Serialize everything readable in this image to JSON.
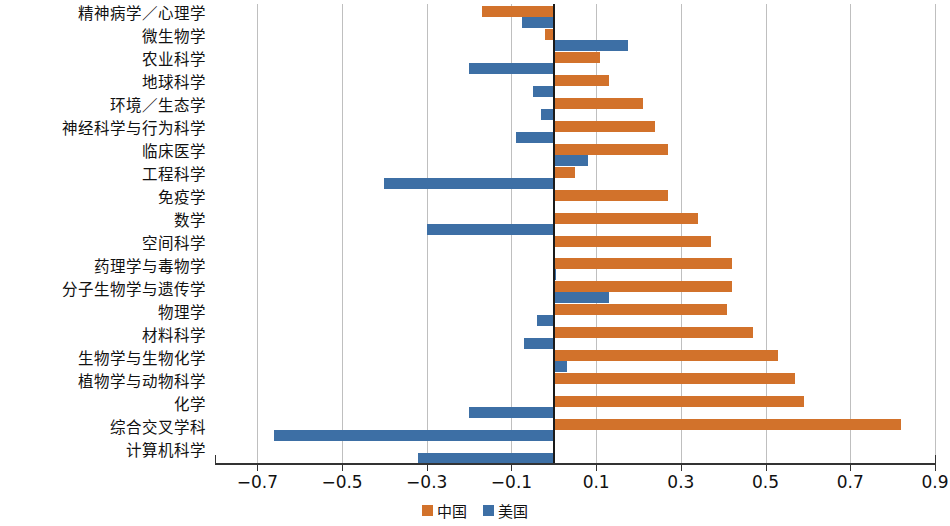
{
  "chart_data": {
    "type": "bar",
    "orientation": "horizontal",
    "title": "",
    "subtitle": "",
    "xlabel": "",
    "ylabel": "",
    "xlim": [
      -0.7,
      0.9
    ],
    "xticks": [
      "-0.7",
      "-0.5",
      "-0.3",
      "-0.1",
      "0.1",
      "0.3",
      "0.5",
      "0.7",
      "0.9"
    ],
    "xtick_values": [
      -0.7,
      -0.5,
      -0.3,
      -0.1,
      0.1,
      0.3,
      0.5,
      0.7,
      0.9
    ],
    "grid": true,
    "grid_axis": "x",
    "legend_position": "bottom",
    "zero_reference_line": true,
    "categories": [
      "精神病学／心理学",
      "微生物学",
      "农业科学",
      "地球科学",
      "环境／生态学",
      "神经科学与行为科学",
      "临床医学",
      "工程科学",
      "免疫学",
      "数学",
      "空间科学",
      "药理学与毒物学",
      "分子生物学与遗传学",
      "物理学",
      "材料科学",
      "生物学与生物化学",
      "植物学与动物科学",
      "化学",
      "综合交叉学科",
      "计算机科学"
    ],
    "series": [
      {
        "name": "中国",
        "color": "#d2722b",
        "values": [
          -0.17,
          -0.02,
          0.11,
          0.13,
          0.21,
          0.24,
          0.27,
          0.05,
          0.27,
          0.34,
          0.37,
          0.42,
          0.42,
          0.41,
          0.47,
          0.53,
          0.57,
          0.59,
          0.82,
          0.0
        ]
      },
      {
        "name": "美国",
        "color": "#3d6fa5",
        "values": [
          -0.075,
          0.175,
          -0.2,
          -0.05,
          -0.03,
          -0.09,
          0.08,
          -0.4,
          0.0,
          -0.3,
          0.0,
          0.005,
          0.13,
          -0.04,
          -0.07,
          0.03,
          0.0,
          -0.2,
          -0.66,
          -0.32
        ]
      }
    ]
  },
  "legend": {
    "items": [
      {
        "label": "中国",
        "color": "#d2722b",
        "swatch": "legend-swatch-china"
      },
      {
        "label": "美国",
        "color": "#3d6fa5",
        "swatch": "legend-swatch-usa"
      }
    ]
  }
}
